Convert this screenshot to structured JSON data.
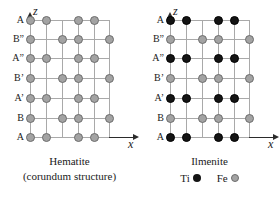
{
  "figure": {
    "panels": [
      {
        "id": "hematite",
        "title": "Hematite",
        "subtitle": "(corundum structure)",
        "axis": {
          "vertical_label": "z",
          "horizontal_label": "x"
        },
        "row_labels": [
          "A",
          "B”",
          "A”",
          "B’",
          "A’",
          "B",
          "A"
        ],
        "row_types": [
          "A",
          "B",
          "A",
          "B",
          "A",
          "B",
          "A"
        ],
        "atom_colors": [
          "#a3a3a3",
          "#a3a3a3",
          "#a3a3a3",
          "#a3a3a3",
          "#a3a3a3",
          "#a3a3a3",
          "#a3a3a3"
        ],
        "legend": []
      },
      {
        "id": "ilmenite",
        "title": "Ilmenite",
        "subtitle": "",
        "axis": {
          "vertical_label": "z",
          "horizontal_label": "x"
        },
        "row_labels": [
          "A",
          "B”",
          "A”",
          "B’",
          "A’",
          "B",
          "A"
        ],
        "row_types": [
          "A",
          "B",
          "A",
          "B",
          "A",
          "B",
          "A"
        ],
        "atom_colors": [
          "#141414",
          "#a3a3a3",
          "#141414",
          "#a3a3a3",
          "#141414",
          "#a3a3a3",
          "#141414"
        ],
        "legend": [
          {
            "label": "Ti",
            "color": "#141414"
          },
          {
            "label": "Fe",
            "color": "#a3a3a3"
          }
        ]
      }
    ],
    "lattice": {
      "columns": 6,
      "rows": 7,
      "column_x": [
        0,
        16,
        32,
        48,
        64,
        79
      ],
      "row_y": [
        0,
        19,
        38,
        58,
        78,
        98,
        117
      ],
      "grid_v_x": [
        0,
        16,
        32,
        48,
        64,
        79
      ],
      "grid_h_y": [
        0,
        19,
        38,
        58,
        78,
        98,
        117
      ],
      "occupancy_A": [
        0,
        1,
        3,
        4
      ],
      "occupancy_B": [
        0,
        2,
        3,
        5
      ]
    },
    "colors": {
      "axis": "#2b2b2b",
      "grid": "#a9a9a9",
      "atom_gray": "#a3a3a3",
      "atom_gray_edge": "#6d6d6d",
      "atom_black": "#141414",
      "background": "#ffffff"
    }
  }
}
